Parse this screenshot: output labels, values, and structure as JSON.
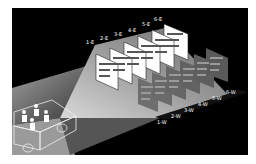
{
  "diagram": {
    "type": "illustration",
    "colors": {
      "background": "#000000",
      "frame": "#ffffff",
      "beam": "#9a9a9a",
      "sign_east": "#ffffff",
      "sign_west": "#6e6e6e",
      "label": "#ffffff"
    },
    "east_signs": [
      {
        "label": "1-E",
        "lines": [
          "Driveway",
          "Parcel",
          "Fiber"
        ]
      },
      {
        "label": "2-E",
        "lines": [
          "Driveway",
          "Parcel",
          "Fiber"
        ]
      },
      {
        "label": "3-E",
        "lines": [
          "Driveway",
          "Parcel",
          "Fiber"
        ]
      },
      {
        "label": "4-E",
        "lines": [
          "Driveway",
          "Parcel",
          "Fiber"
        ]
      },
      {
        "label": "5-E",
        "lines": [
          "Driveway",
          "Parcel",
          "Fiber"
        ]
      },
      {
        "label": "6-E",
        "lines": [
          "Driveway",
          "Parcel",
          "Fiber"
        ]
      }
    ],
    "west_signs": [
      {
        "label": "1-W",
        "lines": [
          "Driveway",
          "Parcel",
          "Fiber"
        ]
      },
      {
        "label": "2-W",
        "lines": [
          "Driveway",
          "Parcel",
          "Fiber"
        ]
      },
      {
        "label": "3-W",
        "lines": [
          "Driveway",
          "Parcel",
          "Fiber"
        ]
      },
      {
        "label": "4-W",
        "lines": [
          "Driveway",
          "Parcel",
          "Fiber"
        ]
      },
      {
        "label": "5-W",
        "lines": [
          "Driveway",
          "Parcel",
          "Fiber"
        ]
      },
      {
        "label": "6-W",
        "lines": [
          "Driveway",
          "Parcel",
          "Fiber"
        ]
      }
    ],
    "vehicle": {
      "passengers": 4
    }
  }
}
